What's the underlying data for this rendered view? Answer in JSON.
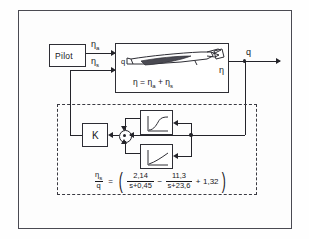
{
  "diagram": {
    "colors": {
      "line": "#24242a",
      "frame": "#4a4a52",
      "background": "#fdfdfd"
    }
  },
  "blocks": {
    "pilot": {
      "label": "Pilot"
    },
    "aircraft": {
      "equation_eta": "η",
      "equation_eq": "=",
      "equation_eta_a": "η",
      "equation_sub_a": "a",
      "equation_plus": "+",
      "equation_eta_s": "η",
      "equation_sub_s": "s",
      "input_label_q": "q",
      "output_label_eta": "η"
    },
    "gain": {
      "label": "K"
    },
    "filter_upper": {
      "icon": "lag-response-curve-icon"
    },
    "filter_lower": {
      "icon": "rising-response-curve-icon"
    },
    "summing_junction": {
      "icon": "summing-junction-icon"
    }
  },
  "signals": {
    "eta_a": {
      "symbol": "η",
      "subscript": "a"
    },
    "eta_s": {
      "symbol": "η",
      "subscript": "s"
    },
    "q_out": {
      "symbol": "q"
    }
  },
  "formula": {
    "lhs_num_symbol": "η",
    "lhs_num_sub": "s",
    "lhs_den": "q",
    "equals": "=",
    "open_paren": "(",
    "term1_num": "2,14",
    "term1_den": "s+0,45",
    "minus": "−",
    "term2_num": "11,3",
    "term2_den": "s+23,6",
    "plus": "+",
    "term3": "1,32",
    "close_paren": ")"
  }
}
